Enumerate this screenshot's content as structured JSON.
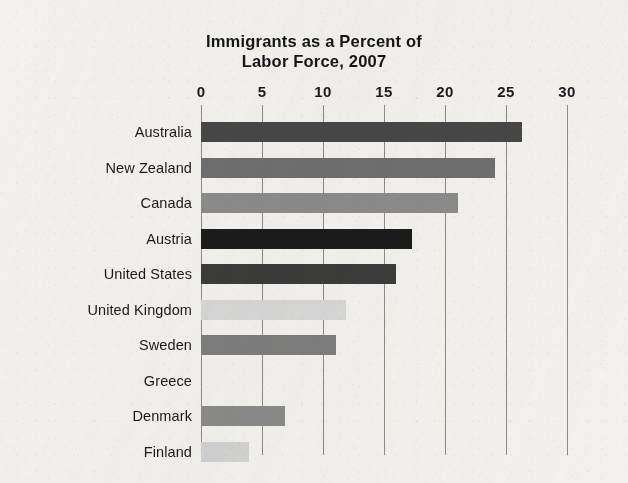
{
  "chart_data": {
    "type": "bar",
    "orientation": "horizontal",
    "title": "Immigrants as a Percent of Labor Force, 2007",
    "title_lines": [
      "Immigrants as a Percent of",
      "Labor Force, 2007"
    ],
    "xlabel": "",
    "ylabel": "",
    "xlim": [
      0,
      30
    ],
    "xticks": [
      0,
      5,
      10,
      15,
      20,
      25,
      30
    ],
    "xtick_labels": [
      "0",
      "5",
      "10",
      "15",
      "20",
      "25",
      "30"
    ],
    "grid": "vertical",
    "legend": "none",
    "categories": [
      "Australia",
      "New Zealand",
      "Canada",
      "Austria",
      "United States",
      "United Kingdom",
      "Sweden",
      "Greece",
      "Denmark",
      "Finland"
    ],
    "values": [
      26.3,
      24.1,
      21.1,
      17.3,
      16.0,
      11.9,
      11.1,
      0.0,
      6.9,
      3.9
    ],
    "bar_colors": [
      "#474747",
      "#6f6f6f",
      "#8b8b8b",
      "#1c1c1c",
      "#3b3b3b",
      "#d7d7d7",
      "#7d7d7d",
      "#ffffff",
      "#8a8a8a",
      "#d2d2d2"
    ],
    "bars": [
      {
        "category": "Australia",
        "value": 26.3,
        "color": "#474747"
      },
      {
        "category": "New Zealand",
        "value": 24.1,
        "color": "#6f6f6f"
      },
      {
        "category": "Canada",
        "value": 21.1,
        "color": "#8b8b8b"
      },
      {
        "category": "Austria",
        "value": 17.3,
        "color": "#1c1c1c"
      },
      {
        "category": "United States",
        "value": 16.0,
        "color": "#3b3b3b"
      },
      {
        "category": "United Kingdom",
        "value": 11.9,
        "color": "#d7d7d7"
      },
      {
        "category": "Sweden",
        "value": 11.1,
        "color": "#7d7d7d"
      },
      {
        "category": "Greece",
        "value": 0.0,
        "color": "#ffffff"
      },
      {
        "category": "Denmark",
        "value": 6.9,
        "color": "#8a8a8a"
      },
      {
        "category": "Finland",
        "value": 3.9,
        "color": "#d2d2d2"
      }
    ],
    "gridline_color": "#8d8b86",
    "background_color": "#f2f1ee"
  }
}
